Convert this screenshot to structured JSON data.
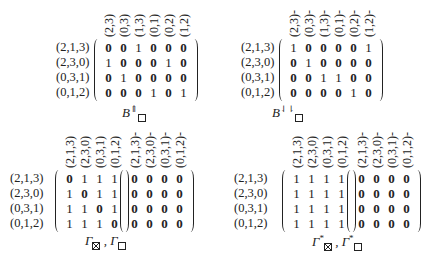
{
  "panels": [
    {
      "id": "b-up",
      "caption": {
        "base": "B",
        "sup": "⇑",
        "sub_symbol": "box"
      },
      "row_labels": [
        "(2,1,3)",
        "(2,3,0)",
        "(0,3,1)",
        "(0,1,2)"
      ],
      "matrices": [
        {
          "col_labels": [
            "(2,3)",
            "(0,3)",
            "(1,3)",
            "(0,1)",
            "(0,2)",
            "(1,2)"
          ],
          "values": [
            [
              0,
              0,
              1,
              0,
              0,
              0
            ],
            [
              1,
              0,
              0,
              0,
              1,
              0
            ],
            [
              0,
              1,
              0,
              0,
              0,
              0
            ],
            [
              0,
              0,
              0,
              1,
              0,
              1
            ]
          ]
        }
      ]
    },
    {
      "id": "b-down",
      "caption": {
        "base": "B",
        "sup": "⇃⇂",
        "sub_symbol": "box"
      },
      "row_labels": [
        "(2,1,3)",
        "(2,3,0)",
        "(0,3,1)",
        "(0,1,2)"
      ],
      "matrices": [
        {
          "col_labels": [
            "(2,3)-",
            "(0,3)-",
            "(1,3)-",
            "(0,1)-",
            "(0,2)-",
            "(1,2)-"
          ],
          "values": [
            [
              1,
              0,
              0,
              0,
              0,
              1
            ],
            [
              0,
              1,
              0,
              0,
              0,
              0
            ],
            [
              0,
              0,
              1,
              1,
              0,
              0
            ],
            [
              0,
              0,
              0,
              0,
              1,
              0
            ]
          ]
        }
      ]
    },
    {
      "id": "gamma",
      "caption": {
        "text": "Γ",
        "sub1": "xbox",
        "sep": " , ",
        "text2": "Γ",
        "sub2": "box"
      },
      "row_labels": [
        "(2,1,3)",
        "(2,3,0)",
        "(0,3,1)",
        "(0,1,2)"
      ],
      "matrices": [
        {
          "col_labels": [
            "(2,1,3)",
            "(2,3,0)",
            "(0,3,1)",
            "(0,1,2)"
          ],
          "values": [
            [
              0,
              1,
              1,
              1
            ],
            [
              1,
              0,
              1,
              1
            ],
            [
              1,
              1,
              0,
              1
            ],
            [
              1,
              1,
              1,
              0
            ]
          ]
        },
        {
          "col_labels": [
            "(2,1,3)-",
            "(2,3,0)-",
            "(0,3,1)-",
            "(0,1,2)-"
          ],
          "values": [
            [
              0,
              0,
              0,
              0
            ],
            [
              0,
              0,
              0,
              0
            ],
            [
              0,
              0,
              0,
              0
            ],
            [
              0,
              0,
              0,
              0
            ]
          ]
        }
      ]
    },
    {
      "id": "gamma-star",
      "caption": {
        "text": "Γ",
        "sup": "*",
        "sub1": "xbox",
        "sep": " , ",
        "text2": "Γ",
        "sup2": "*",
        "sub2": "box"
      },
      "row_labels": [
        "(2,1,3)",
        "(2,3,0)",
        "(0,3,1)",
        "(0,1,2)"
      ],
      "matrices": [
        {
          "col_labels": [
            "(2,1,3)",
            "(2,3,0)",
            "(0,3,1)",
            "(0,1,2)"
          ],
          "values": [
            [
              1,
              1,
              1,
              1
            ],
            [
              1,
              1,
              1,
              1
            ],
            [
              1,
              1,
              1,
              1
            ],
            [
              1,
              1,
              1,
              1
            ]
          ]
        },
        {
          "col_labels": [
            "(2,1,3)-",
            "(2,3,0)-",
            "(0,3,1)-",
            "(0,1,2)-"
          ],
          "values": [
            [
              0,
              0,
              0,
              0
            ],
            [
              0,
              0,
              0,
              0
            ],
            [
              0,
              0,
              0,
              0
            ],
            [
              0,
              0,
              0,
              0
            ]
          ]
        }
      ]
    }
  ]
}
